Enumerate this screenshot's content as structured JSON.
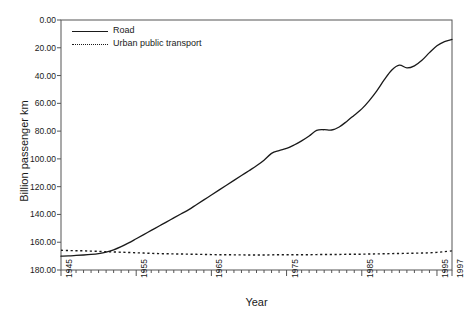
{
  "figure": {
    "ylabel": "Billion passenger km",
    "xlabel": "Year",
    "title_remnant": "............................."
  },
  "legend": {
    "items": [
      {
        "label": "Road",
        "style": "solid"
      },
      {
        "label": "Urban public transport",
        "style": "dotted"
      }
    ]
  },
  "axes": {
    "y_ticks": [
      "180.00",
      "160.00",
      "140.00",
      "120.00",
      "100.00",
      "80.00",
      "60.00",
      "40.00",
      "20.00",
      "0.00"
    ],
    "x_ticks": [
      "1945",
      "1955",
      "1965",
      "1975",
      "1985",
      "1995",
      "1997"
    ]
  },
  "chart_data": {
    "type": "line",
    "title": "",
    "xlabel": "Year",
    "ylabel": "Billion passenger km",
    "xlim": [
      1945,
      1997
    ],
    "ylim": [
      0,
      180
    ],
    "ytick_values": [
      0,
      20,
      40,
      60,
      80,
      100,
      120,
      140,
      160,
      180
    ],
    "xtick_values": [
      1945,
      1955,
      1965,
      1975,
      1985,
      1995,
      1997
    ],
    "x_minor_tick_interval": 1,
    "grid": false,
    "legend_position": "upper left inside",
    "x": [
      1945,
      1946,
      1947,
      1948,
      1949,
      1950,
      1951,
      1952,
      1953,
      1954,
      1955,
      1956,
      1957,
      1958,
      1959,
      1960,
      1961,
      1962,
      1963,
      1964,
      1965,
      1966,
      1967,
      1968,
      1969,
      1970,
      1971,
      1972,
      1973,
      1974,
      1975,
      1976,
      1977,
      1978,
      1979,
      1980,
      1981,
      1982,
      1983,
      1984,
      1985,
      1986,
      1987,
      1988,
      1989,
      1990,
      1991,
      1992,
      1993,
      1994,
      1995,
      1996,
      1997
    ],
    "series": [
      {
        "name": "Road",
        "style": "solid",
        "color": "#1a1a1a",
        "values": [
          10.0,
          10.2,
          10.5,
          10.8,
          11.2,
          11.8,
          12.8,
          14.5,
          16.8,
          19.5,
          22.5,
          25.5,
          28.5,
          31.5,
          34.5,
          37.5,
          40.5,
          43.5,
          47.0,
          50.5,
          54.0,
          57.5,
          61.0,
          64.5,
          68.0,
          71.5,
          75.0,
          79.0,
          84.0,
          86.0,
          87.5,
          90.0,
          93.0,
          96.5,
          100.5,
          101.0,
          100.8,
          103.0,
          107.0,
          111.5,
          116.0,
          122.0,
          129.0,
          137.0,
          144.0,
          147.5,
          145.5,
          147.0,
          151.0,
          156.5,
          161.5,
          164.5,
          166.0
        ]
      },
      {
        "name": "Urban public transport",
        "style": "dotted",
        "color": "#1a1a1a",
        "values": [
          14.2,
          14.0,
          13.9,
          13.8,
          13.6,
          13.4,
          13.2,
          13.0,
          12.8,
          12.6,
          12.4,
          12.2,
          12.0,
          11.8,
          11.7,
          11.6,
          11.5,
          11.4,
          11.3,
          11.2,
          11.1,
          11.0,
          11.0,
          10.9,
          10.9,
          10.8,
          10.8,
          10.8,
          10.9,
          11.0,
          11.0,
          11.0,
          11.0,
          11.0,
          11.1,
          11.2,
          11.2,
          11.2,
          11.3,
          11.3,
          11.4,
          11.5,
          11.6,
          11.7,
          11.8,
          11.9,
          12.0,
          12.1,
          12.2,
          12.4,
          12.7,
          13.2,
          13.8
        ]
      }
    ]
  }
}
